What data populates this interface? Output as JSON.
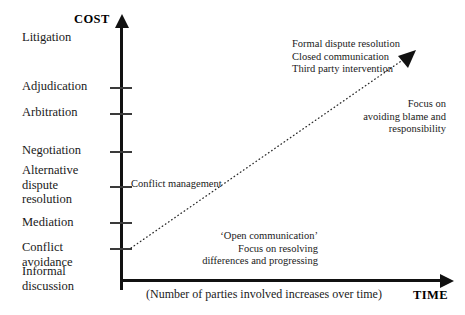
{
  "diagram": {
    "axes": {
      "y_title": "COST",
      "x_title": "TIME",
      "x_note": "(Number of parties involved increases over time)"
    },
    "stages": [
      {
        "label": "Litigation",
        "has_tick": false
      },
      {
        "label": "Adjudication",
        "has_tick": true
      },
      {
        "label": "Arbitration",
        "has_tick": true
      },
      {
        "label": "Negotiation",
        "has_tick": true
      },
      {
        "label": "Alternative\ndispute\nresolution",
        "has_tick": true
      },
      {
        "label": "Mediation",
        "has_tick": true
      },
      {
        "label": "Conflict\navoidance",
        "has_tick": true
      },
      {
        "label": "Informal\ndiscussion",
        "has_tick": false
      }
    ],
    "annotations": {
      "escalation": "Formal dispute resolution\nClosed communication\nThird party intervention",
      "blame": "Focus on\navoiding blame and\nresponsibility",
      "conflict_management": "Conflict management",
      "open_communication": "‘Open communication’\nFocus on resolving\ndifferences and progressing"
    },
    "colors": {
      "axis": "#111111",
      "tick": "#3a3a3a",
      "text": "#1a1a1a",
      "trend": "#2b2b2b",
      "background": "#ffffff"
    }
  },
  "chart_data": {
    "type": "line",
    "title": "",
    "xlabel": "TIME",
    "ylabel": "COST",
    "categories": [
      "Informal discussion",
      "Conflict avoidance",
      "Mediation",
      "Alternative dispute resolution",
      "Negotiation",
      "Arbitration",
      "Adjudication",
      "Litigation"
    ],
    "values": [
      1,
      2,
      3,
      4,
      5,
      6,
      7,
      8
    ],
    "series": [
      {
        "name": "Escalation trend",
        "style": "dotted-arrow",
        "points": [
          [
            0.05,
            0.12
          ],
          [
            1.0,
            0.86
          ]
        ]
      }
    ],
    "grid": false,
    "legend": "none"
  }
}
